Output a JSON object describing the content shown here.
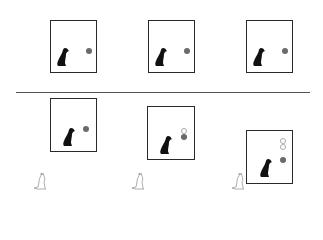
{
  "diagram": {
    "colors": {
      "box_border": "#2a2a2a",
      "dot": "#6a6a6a",
      "ring": "#aaaaaa",
      "divider": "#555555",
      "dog": "#111111",
      "cat": "#999999"
    },
    "top_row": [
      {
        "label": "panel-1",
        "box": [
          50,
          20,
          47,
          53
        ],
        "dog": [
          56,
          47
        ],
        "dots_filled": [
          [
            86,
            48
          ]
        ],
        "dots_empty": []
      },
      {
        "label": "panel-2",
        "box": [
          148,
          20,
          47,
          53
        ],
        "dog": [
          154,
          47
        ],
        "dots_filled": [
          [
            184,
            48
          ]
        ],
        "dots_empty": []
      },
      {
        "label": "panel-3",
        "box": [
          246,
          20,
          47,
          53
        ],
        "dog": [
          252,
          47
        ],
        "dots_filled": [
          [
            282,
            48
          ]
        ],
        "dots_empty": []
      }
    ],
    "bottom_row": [
      {
        "label": "panel-4",
        "box": [
          50,
          98,
          47,
          54
        ],
        "dog": [
          62,
          127
        ],
        "dots_filled": [
          [
            83,
            126
          ]
        ],
        "dots_empty": [],
        "cat": [
          33,
          172
        ]
      },
      {
        "label": "panel-5",
        "box": [
          147,
          106,
          48,
          54
        ],
        "dog": [
          159,
          135
        ],
        "dots_filled": [
          [
            181,
            134
          ]
        ],
        "dots_empty": [
          [
            181,
            128
          ]
        ],
        "cat": [
          131,
          172
        ]
      },
      {
        "label": "panel-6",
        "box": [
          246,
          130,
          47,
          54
        ],
        "dog": [
          259,
          158
        ],
        "dots_filled": [
          [
            280,
            157
          ]
        ],
        "dots_empty": [
          [
            280,
            138
          ],
          [
            280,
            144
          ]
        ],
        "cat": [
          231,
          172
        ]
      }
    ]
  }
}
